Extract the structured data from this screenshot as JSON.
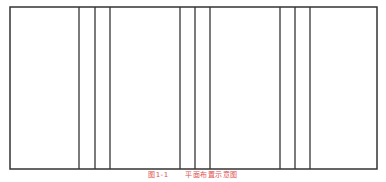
{
  "diagram": {
    "stroke_color": "#333333",
    "outer_rect": {
      "x": 10,
      "y": 7,
      "width": 367,
      "height": 162
    },
    "vertical_lines_x": [
      79,
      95,
      110,
      180,
      195,
      210,
      280,
      295,
      310
    ],
    "panels": [
      {
        "label": "panel-1",
        "x1": 10,
        "x2": 79
      },
      {
        "label": "strip-1a",
        "x1": 79,
        "x2": 95
      },
      {
        "label": "strip-1b",
        "x1": 95,
        "x2": 110
      },
      {
        "label": "panel-2",
        "x1": 110,
        "x2": 180
      },
      {
        "label": "strip-2a",
        "x1": 180,
        "x2": 195
      },
      {
        "label": "strip-2b",
        "x1": 195,
        "x2": 210
      },
      {
        "label": "panel-3",
        "x1": 210,
        "x2": 280
      },
      {
        "label": "strip-3a",
        "x1": 280,
        "x2": 295
      },
      {
        "label": "strip-3b",
        "x1": 295,
        "x2": 310
      },
      {
        "label": "panel-4",
        "x1": 310,
        "x2": 377
      }
    ]
  },
  "caption": {
    "number": "图1-1",
    "text": "平面布置示意图",
    "color": "#e05050"
  }
}
